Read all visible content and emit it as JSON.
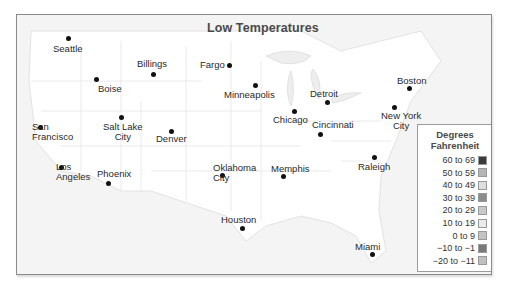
{
  "map": {
    "title": "Low Temperatures",
    "cities": [
      {
        "name": "Seattle",
        "label_lines": [
          "Seattle"
        ],
        "dot": [
          67,
          37
        ],
        "label": [
          52,
          43
        ],
        "align": "left"
      },
      {
        "name": "Billings",
        "label_lines": [
          "Billings"
        ],
        "dot": [
          152,
          73
        ],
        "label": [
          136,
          58
        ],
        "align": "left"
      },
      {
        "name": "Fargo",
        "label_lines": [
          "Fargo"
        ],
        "dot": [
          228,
          64
        ],
        "label": [
          199,
          59
        ],
        "align": "left"
      },
      {
        "name": "Boise",
        "label_lines": [
          "Boise"
        ],
        "dot": [
          95,
          78
        ],
        "label": [
          97,
          83
        ],
        "align": "left"
      },
      {
        "name": "Minneapolis",
        "label_lines": [
          "Minneapolis"
        ],
        "dot": [
          254,
          84
        ],
        "label": [
          223,
          89
        ],
        "align": "left"
      },
      {
        "name": "Detroit",
        "label_lines": [
          "Detroit"
        ],
        "dot": [
          326,
          101
        ],
        "label": [
          309,
          88
        ],
        "align": "left"
      },
      {
        "name": "Boston",
        "label_lines": [
          "Boston"
        ],
        "dot": [
          408,
          87
        ],
        "label": [
          396,
          75
        ],
        "align": "left"
      },
      {
        "name": "New York City",
        "label_lines": [
          "New York",
          "City"
        ],
        "dot": [
          393,
          106
        ],
        "label": [
          380,
          110
        ],
        "align": "center"
      },
      {
        "name": "Chicago",
        "label_lines": [
          "Chicago"
        ],
        "dot": [
          293,
          110
        ],
        "label": [
          272,
          114
        ],
        "align": "left"
      },
      {
        "name": "Cincinnati",
        "label_lines": [
          "Cincinnati"
        ],
        "dot": [
          319,
          133
        ],
        "label": [
          311,
          119
        ],
        "align": "left"
      },
      {
        "name": "San Francisco",
        "label_lines": [
          "San",
          "Francisco"
        ],
        "dot": [
          39,
          126
        ],
        "label": [
          31,
          121
        ],
        "align": "left"
      },
      {
        "name": "Salt Lake City",
        "label_lines": [
          "Salt Lake",
          "City"
        ],
        "dot": [
          120,
          116
        ],
        "label": [
          102,
          121
        ],
        "align": "center"
      },
      {
        "name": "Denver",
        "label_lines": [
          "Denver"
        ],
        "dot": [
          170,
          130
        ],
        "label": [
          155,
          133
        ],
        "align": "left"
      },
      {
        "name": "Los Angeles",
        "label_lines": [
          "Los",
          "Angeles"
        ],
        "dot": [
          60,
          166
        ],
        "label": [
          55,
          161
        ],
        "align": "left"
      },
      {
        "name": "Phoenix",
        "label_lines": [
          "Phoenix"
        ],
        "dot": [
          107,
          182
        ],
        "label": [
          96,
          168
        ],
        "align": "left"
      },
      {
        "name": "Oklahoma City",
        "label_lines": [
          "Oklahoma",
          "City"
        ],
        "dot": [
          221,
          174
        ],
        "label": [
          212,
          162
        ],
        "align": "left"
      },
      {
        "name": "Memphis",
        "label_lines": [
          "Memphis"
        ],
        "dot": [
          282,
          175
        ],
        "label": [
          270,
          163
        ],
        "align": "left"
      },
      {
        "name": "Raleigh",
        "label_lines": [
          "Raleigh"
        ],
        "dot": [
          373,
          156
        ],
        "label": [
          357,
          161
        ],
        "align": "left"
      },
      {
        "name": "Houston",
        "label_lines": [
          "Houston"
        ],
        "dot": [
          241,
          227
        ],
        "label": [
          220,
          214
        ],
        "align": "left"
      },
      {
        "name": "Miami",
        "label_lines": [
          "Miami"
        ],
        "dot": [
          371,
          253
        ],
        "label": [
          354,
          241
        ],
        "align": "left"
      }
    ]
  },
  "legend": {
    "title_line1": "Degrees",
    "title_line2": "Fahrenheit",
    "items": [
      {
        "label": "60 to 69",
        "color": "#3a3a3a"
      },
      {
        "label": "50 to 59",
        "color": "#b5b5b5"
      },
      {
        "label": "40 to 49",
        "color": "#dedede"
      },
      {
        "label": "30 to 39",
        "color": "#8c8c8c"
      },
      {
        "label": "20 to 29",
        "color": "#c9c9c9"
      },
      {
        "label": "10 to 19",
        "color": "#ebebeb"
      },
      {
        "label": "0 to 9",
        "color": "#c3c3c3"
      },
      {
        "label": "−10 to −1",
        "color": "#7a7a7a"
      },
      {
        "label": "−20 to −11",
        "color": "#c0c0c0"
      }
    ]
  }
}
